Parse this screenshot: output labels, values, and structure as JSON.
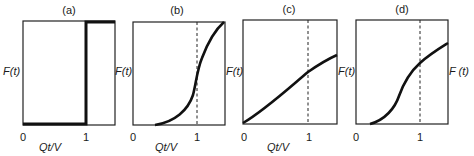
{
  "figure": {
    "panels": [
      {
        "id": "a",
        "title": "(a)",
        "ylabel": "F(t)",
        "xlabel": "Qt/V",
        "x_ticks": [
          "0",
          "1"
        ],
        "curve": "step",
        "dashed_at_1": false
      },
      {
        "id": "b",
        "title": "(b)",
        "ylabel": "F(t)",
        "xlabel": "Qt/V",
        "x_ticks": [
          "0",
          "1"
        ],
        "curve": "steep-sigmoid",
        "dashed_at_1": true
      },
      {
        "id": "c",
        "title": "(c)",
        "ylabel": "F(t)",
        "xlabel": "Qt/V",
        "x_ticks": [
          "0",
          "1"
        ],
        "curve": "near-linear-concave",
        "dashed_at_1": true
      },
      {
        "id": "d",
        "title": "(d)",
        "ylabel": "F(t)",
        "xlabel": "",
        "x_ticks": [
          "0",
          "1"
        ],
        "curve": "delayed-sigmoid",
        "dashed_at_1": true
      }
    ],
    "right_label": "F (t)",
    "colors": {
      "line": "#111111",
      "frame": "#222222",
      "background": "#ffffff"
    }
  }
}
